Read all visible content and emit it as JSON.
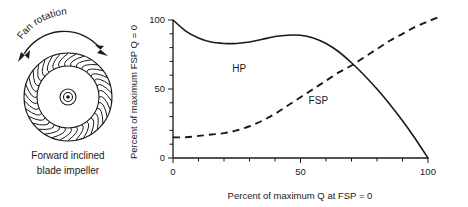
{
  "figure": {
    "diagram": {
      "rotation_label": "Fan  rotation",
      "caption_line1": "Forward inclined",
      "caption_line2": "blade impeller",
      "blade_count": 34
    },
    "axis": {
      "y_title": "Percent of maximum FSP Q = 0",
      "x_title": "Percent of maximum Q at FSP = 0",
      "y_ticks": [
        "0",
        "50",
        "100"
      ],
      "x_ticks": [
        "0",
        "50",
        "100"
      ]
    },
    "colors": {
      "ink": "#1a1a1a",
      "background": "#ffffff"
    }
  },
  "chart_data": {
    "type": "line",
    "title": "",
    "xlabel": "Percent of maximum Q at FSP = 0",
    "ylabel": "Percent of maximum FSP Q = 0",
    "xlim": [
      0,
      100
    ],
    "ylim": [
      0,
      100
    ],
    "xticks": [
      0,
      10,
      20,
      30,
      40,
      50,
      60,
      70,
      80,
      90,
      100
    ],
    "xticklabels": [
      "0",
      "",
      "",
      "",
      "",
      "50",
      "",
      "",
      "",
      "",
      "100"
    ],
    "yticks": [
      0,
      10,
      20,
      30,
      40,
      50,
      60,
      70,
      80,
      90,
      100
    ],
    "yticklabels": [
      "0",
      "",
      "",
      "",
      "",
      "50",
      "",
      "",
      "",
      "",
      "100"
    ],
    "grid": false,
    "legend": "inline-annotations",
    "series": [
      {
        "name": "HP",
        "style": "solid",
        "label_x": 26,
        "label_y": 62,
        "x": [
          0,
          5,
          10,
          15,
          20,
          25,
          30,
          35,
          40,
          45,
          50,
          55,
          60,
          65,
          70,
          75,
          80,
          85,
          90,
          95,
          100
        ],
        "y": [
          100,
          92,
          87,
          84,
          83,
          83,
          84,
          86,
          88,
          89,
          89,
          87,
          83,
          77,
          69,
          60,
          50,
          39,
          27,
          14,
          0
        ]
      },
      {
        "name": "FSP",
        "style": "dashed",
        "label_x": 57,
        "label_y": 39,
        "x": [
          0,
          5,
          10,
          15,
          20,
          25,
          30,
          35,
          40,
          45,
          50,
          55,
          60,
          65,
          70,
          75,
          80,
          85,
          90,
          95,
          100,
          104
        ],
        "y": [
          15,
          15,
          16,
          17,
          18,
          20,
          23,
          27,
          32,
          38,
          44,
          50,
          56,
          62,
          67,
          73,
          79,
          85,
          90,
          95,
          99,
          102
        ]
      }
    ]
  }
}
